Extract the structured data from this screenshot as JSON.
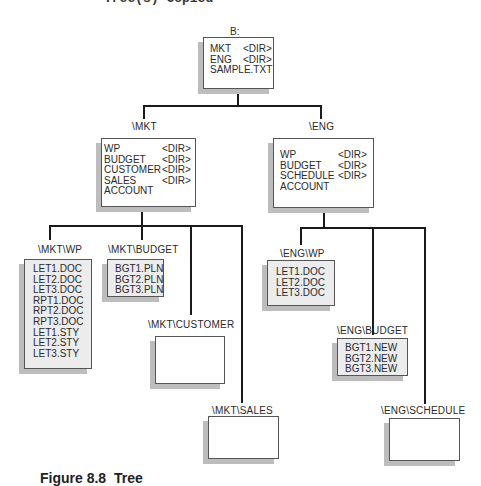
{
  "page": {
    "top_text_cut": "Tree(s) Copied",
    "caption_cut": "Figure 8.8  Tree"
  },
  "tree": {
    "root": {
      "label": "B:",
      "entries": [
        {
          "name": "MKT",
          "type": "<DIR>"
        },
        {
          "name": "ENG",
          "type": "<DIR>"
        },
        {
          "name": "SAMPLE.TXT",
          "type": ""
        }
      ]
    },
    "mkt": {
      "label": "\\MKT",
      "entries": [
        {
          "name": "WP",
          "type": "<DIR>"
        },
        {
          "name": "BUDGET",
          "type": "<DIR>"
        },
        {
          "name": "CUSTOMER",
          "type": "<DIR>"
        },
        {
          "name": "SALES",
          "type": "<DIR>"
        },
        {
          "name": "ACCOUNT",
          "type": ""
        }
      ]
    },
    "eng": {
      "label": "\\ENG",
      "entries": [
        {
          "name": "WP",
          "type": "<DIR>"
        },
        {
          "name": "BUDGET",
          "type": "<DIR>"
        },
        {
          "name": "SCHEDULE",
          "type": "<DIR>"
        },
        {
          "name": "ACCOUNT",
          "type": ""
        }
      ]
    },
    "mkt_wp": {
      "label": "\\MKT\\WP",
      "files": [
        "LET1.DOC",
        "LET2.DOC",
        "LET3.DOC",
        "RPT1.DOC",
        "RPT2.DOC",
        "RPT3.DOC",
        "LET1.STY",
        "LET2.STY",
        "LET3.STY"
      ]
    },
    "mkt_budget": {
      "label": "\\MKT\\BUDGET",
      "files": [
        "BGT1.PLN",
        "BGT2.PLN",
        "BGT3.PLN"
      ]
    },
    "mkt_customer": {
      "label": "\\MKT\\CUSTOMER",
      "files": []
    },
    "mkt_sales": {
      "label": "\\MKT\\SALES",
      "files": []
    },
    "eng_wp": {
      "label": "\\ENG\\WP",
      "files": [
        "LET1.DOC",
        "LET2.DOC",
        "LET3.DOC"
      ]
    },
    "eng_budget": {
      "label": "\\ENG\\BUDGET",
      "files": [
        "BGT1.NEW",
        "BGT2.NEW",
        "BGT3.NEW"
      ]
    },
    "eng_schedule": {
      "label": "\\ENG\\SCHEDULE",
      "files": []
    }
  },
  "colors": {
    "line": "#1a1a1a",
    "copied_box_fill": "#ececec",
    "empty_box_fill": "#ffffff",
    "shadow": "#bdbdbd"
  }
}
